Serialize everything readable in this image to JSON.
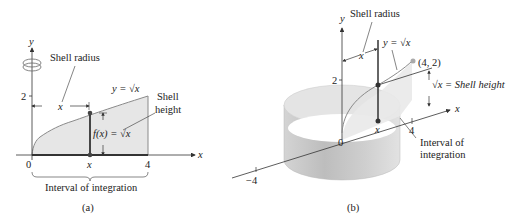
{
  "panel_a": {
    "caption": "(a)",
    "y_axis_label": "y",
    "x_axis_label": "x",
    "tick_2": "2",
    "origin": "0",
    "x_label": "x",
    "tick_4": "4",
    "shell_radius": "Shell radius",
    "radius_x": "x",
    "curve_label": "y = √x",
    "shell_height_1": "Shell",
    "shell_height_2": "height",
    "fx_label": "f(x) = √x",
    "interval": "Interval of integration",
    "rotation_icon": "rotation-arrow-icon"
  },
  "panel_b": {
    "caption": "(b)",
    "y_axis_label": "y",
    "x_axis_label": "x",
    "tick_2": "2",
    "origin": "0",
    "x_label": "x",
    "tick_4": "4",
    "tick_neg4": "−4",
    "shell_radius": "Shell radius",
    "radius_x": "x",
    "curve_label": "y = √x",
    "point_label": "(4, 2)",
    "shell_height": "√x = Shell height",
    "interval_1": "Interval of",
    "interval_2": "integration"
  },
  "colors": {
    "fill": "#e6e6e6",
    "curve": "#8a8a8a",
    "line": "#333333",
    "cylinder_light": "#e8e8e8",
    "cylinder_dark": "#b5b5b5"
  }
}
